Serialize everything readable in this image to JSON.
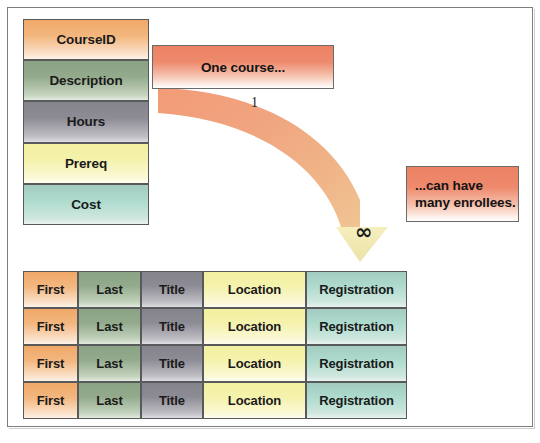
{
  "diagram": {
    "background_color": "#ffffff",
    "frame_border_color": "#7d7d7d"
  },
  "top_cropped_text": "",
  "entity": {
    "name": "Course",
    "attributes": [
      {
        "label": "CourseID",
        "color": "#f0a868",
        "color_name": "orange"
      },
      {
        "label": "Description",
        "color": "#8aa384",
        "color_name": "green"
      },
      {
        "label": "Hours",
        "color": "#85838c",
        "color_name": "gray"
      },
      {
        "label": "Prereq",
        "color": "#f2f0a0",
        "color_name": "yellow"
      },
      {
        "label": "Cost",
        "color": "#a4cbc0",
        "color_name": "teal"
      }
    ]
  },
  "callouts": {
    "one": {
      "text": "One course...",
      "color": "#ec8163"
    },
    "many": {
      "line1": "...can have",
      "line2": "many enrollees.",
      "color": "#ec8163"
    }
  },
  "relationship": {
    "type": "one-to-many",
    "band_color_start": "#ef9a78",
    "band_color_end": "#f0c08e",
    "arrowhead_color": "#f2eab4",
    "cardinality_source": "1",
    "cardinality_target": "∞",
    "cardinality_target_name": "infinity-symbol"
  },
  "table": {
    "columns": [
      {
        "header": "First",
        "color": "#f0a868",
        "color_name": "orange"
      },
      {
        "header": "Last",
        "color": "#8aa384",
        "color_name": "green"
      },
      {
        "header": "Title",
        "color": "#85838c",
        "color_name": "gray"
      },
      {
        "header": "Location",
        "color": "#f2f0a0",
        "color_name": "yellow"
      },
      {
        "header": "Registration",
        "color": "#a4cbc0",
        "color_name": "teal"
      }
    ],
    "rows": [
      {
        "first": "First",
        "last": "Last",
        "title": "Title",
        "location": "Location",
        "registration": "Registration"
      },
      {
        "first": "First",
        "last": "Last",
        "title": "Title",
        "location": "Location",
        "registration": "Registration"
      },
      {
        "first": "First",
        "last": "Last",
        "title": "Title",
        "location": "Location",
        "registration": "Registration"
      },
      {
        "first": "First",
        "last": "Last",
        "title": "Title",
        "location": "Location",
        "registration": "Registration"
      }
    ]
  }
}
